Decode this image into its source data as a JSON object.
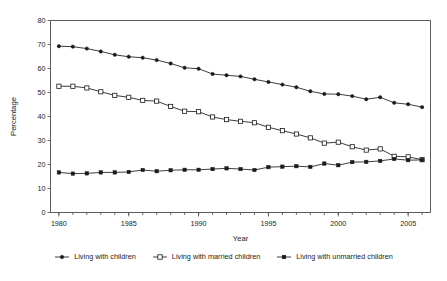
{
  "chart_data": {
    "type": "line",
    "title": "",
    "xlabel": "Year",
    "ylabel": "Percentage",
    "xlim": [
      1979.4,
      2006.6
    ],
    "ylim": [
      0,
      80
    ],
    "ytick_step": 10,
    "yticks": [
      0,
      10,
      20,
      30,
      40,
      50,
      60,
      70,
      80
    ],
    "xticks_major": [
      1980,
      1985,
      1990,
      1995,
      2000,
      2005
    ],
    "xticks_minor_step": 1,
    "grid": false,
    "legend_position": "bottom-center",
    "x": [
      1980,
      1981,
      1982,
      1983,
      1984,
      1985,
      1986,
      1987,
      1988,
      1989,
      1990,
      1991,
      1992,
      1993,
      1994,
      1995,
      1996,
      1997,
      1998,
      1999,
      2000,
      2001,
      2002,
      2003,
      2004,
      2005,
      2006
    ],
    "series": [
      {
        "name": "Living with children",
        "marker": "filled-circle",
        "values": [
          69.3,
          69.1,
          68.3,
          67.1,
          65.7,
          64.9,
          64.5,
          63.5,
          62.1,
          60.3,
          59.9,
          57.7,
          57.2,
          56.7,
          55.5,
          54.4,
          53.3,
          52.2,
          50.5,
          49.4,
          49.3,
          48.5,
          47.2,
          48.0,
          45.7,
          45.1,
          43.9
        ]
      },
      {
        "name": "Living with married children",
        "marker": "open-square",
        "values": [
          52.6,
          52.6,
          51.9,
          50.3,
          48.8,
          48.0,
          46.7,
          46.4,
          44.2,
          42.2,
          42.0,
          39.8,
          38.7,
          38.0,
          37.4,
          35.5,
          34.1,
          32.7,
          31.1,
          28.9,
          29.3,
          27.4,
          26.0,
          26.5,
          23.4,
          23.2,
          22.0
        ]
      },
      {
        "name": "Living with unmarried children",
        "marker": "filled-square",
        "values": [
          16.7,
          16.2,
          16.3,
          16.7,
          16.7,
          16.9,
          17.7,
          17.2,
          17.6,
          17.8,
          17.8,
          18.1,
          18.4,
          18.1,
          17.7,
          18.9,
          19.1,
          19.3,
          19.0,
          20.4,
          19.7,
          21.0,
          21.1,
          21.5,
          22.3,
          21.8,
          21.9
        ]
      }
    ]
  },
  "legend": {
    "items": [
      {
        "label": "Living with children",
        "marker": "filled-circle"
      },
      {
        "label": "Living with married children",
        "marker": "open-square"
      },
      {
        "label": "Living with unmarried children",
        "marker": "filled-square"
      }
    ]
  }
}
